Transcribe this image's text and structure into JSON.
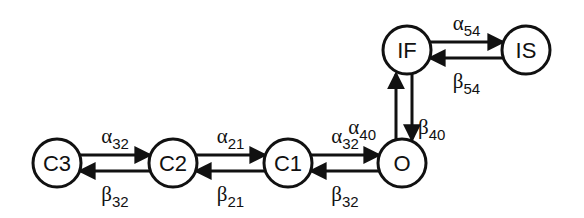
{
  "diagram": {
    "type": "state-transition",
    "nodes": [
      {
        "id": "C3",
        "label": "C3"
      },
      {
        "id": "C2",
        "label": "C2"
      },
      {
        "id": "C1",
        "label": "C1"
      },
      {
        "id": "O",
        "label": "O"
      },
      {
        "id": "IF",
        "label": "IF"
      },
      {
        "id": "IS",
        "label": "IS"
      }
    ],
    "edges": [
      {
        "from": "C3",
        "to": "C2",
        "symbol": "α",
        "sub": "32"
      },
      {
        "from": "C2",
        "to": "C3",
        "symbol": "β",
        "sub": "32"
      },
      {
        "from": "C2",
        "to": "C1",
        "symbol": "α",
        "sub": "21"
      },
      {
        "from": "C1",
        "to": "C2",
        "symbol": "β",
        "sub": "21"
      },
      {
        "from": "C1",
        "to": "O",
        "symbol": "α",
        "sub": "32"
      },
      {
        "from": "O",
        "to": "C1",
        "symbol": "β",
        "sub": "32"
      },
      {
        "from": "O",
        "to": "IF",
        "symbol": "α",
        "sub": "40"
      },
      {
        "from": "IF",
        "to": "O",
        "symbol": "β",
        "sub": "40"
      },
      {
        "from": "IF",
        "to": "IS",
        "symbol": "α",
        "sub": "54"
      },
      {
        "from": "IS",
        "to": "IF",
        "symbol": "β",
        "sub": "54"
      }
    ]
  }
}
